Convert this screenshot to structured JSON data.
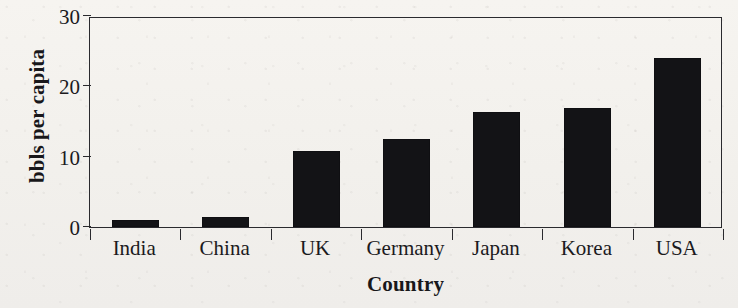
{
  "chart_data": {
    "type": "bar",
    "title": "",
    "subtitle": "",
    "xlabel": "Country",
    "ylabel": "bbls per capita",
    "categories": [
      "India",
      "China",
      "UK",
      "Germany",
      "Japan",
      "Korea",
      "USA"
    ],
    "values": [
      1.0,
      1.4,
      10.8,
      12.5,
      16.3,
      16.9,
      24.1
    ],
    "series": [
      {
        "name": "bbls per capita",
        "values": [
          1.0,
          1.4,
          10.8,
          12.5,
          16.3,
          16.9,
          24.1
        ]
      }
    ],
    "ylim": [
      0,
      30
    ],
    "yticks": [
      0,
      10,
      20,
      30
    ],
    "ytick_labels": [
      "0",
      "10",
      "20",
      "30"
    ],
    "grid": false,
    "legend": false,
    "legend_position": "none",
    "bar_color": "#131316",
    "axis_color": "#2a2a2e",
    "background_color": "#f4f2ee",
    "text_color": "#1b1a1d",
    "annotations": []
  },
  "figure": {
    "plot_left": 89,
    "plot_top": 17,
    "plot_width": 633,
    "plot_height": 211
  }
}
